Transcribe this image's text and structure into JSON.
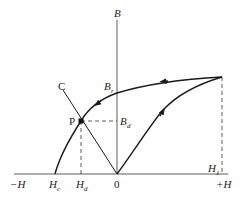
{
  "diagram": {
    "type": "B-H demagnetization curve",
    "axes": {
      "horizontal": {
        "neg_label": "−H",
        "pos_label": "+H",
        "origin_label": "0"
      },
      "vertical": {
        "label": "B"
      }
    },
    "points": {
      "P": {
        "label": "P"
      },
      "C": {
        "label": "C"
      }
    },
    "labels": {
      "Br_main": "B",
      "Br_sub": "r",
      "Bd_main": "B",
      "Bd_sub": "d",
      "Hc_main": "H",
      "Hc_sub": "c",
      "Hd_main": "H",
      "Hd_sub": "d",
      "H1_main": "H",
      "H1_sub": "1"
    },
    "colors": {
      "line": "#1a1a1a",
      "dashed": "#333333"
    }
  }
}
